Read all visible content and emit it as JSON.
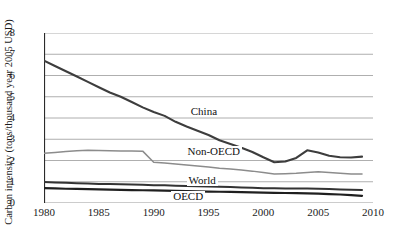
{
  "chart_data": {
    "type": "line",
    "title": "",
    "xlabel": "",
    "ylabel": "Carbon intensity (tons/thousand year 2005 USD)",
    "xlim": [
      1980,
      2010
    ],
    "ylim": [
      0,
      8
    ],
    "xticks": [
      "1980",
      "1985",
      "1990",
      "1995",
      "2000",
      "2005",
      "2010"
    ],
    "yticks": [
      "0",
      "1",
      "2",
      "3",
      "4",
      "5",
      "6",
      "7",
      "8"
    ],
    "grid": "horizontal",
    "legend_position": "inline-labels",
    "x": [
      1980,
      1981,
      1982,
      1983,
      1984,
      1985,
      1986,
      1987,
      1988,
      1989,
      1990,
      1991,
      1992,
      1993,
      1994,
      1995,
      1996,
      1997,
      1998,
      1999,
      2000,
      2001,
      2002,
      2003,
      2004,
      2005,
      2006,
      2007,
      2008,
      2009
    ],
    "series": [
      {
        "name": "China",
        "color": "#3d3d3d",
        "width": 2.1,
        "label": "China",
        "values": [
          6.7,
          6.45,
          6.2,
          5.95,
          5.7,
          5.45,
          5.2,
          5.0,
          4.75,
          4.5,
          4.28,
          4.1,
          3.82,
          3.6,
          3.4,
          3.2,
          2.95,
          2.78,
          2.6,
          2.4,
          2.15,
          1.92,
          1.95,
          2.12,
          2.48,
          2.38,
          2.22,
          2.15,
          2.14,
          2.18
        ]
      },
      {
        "name": "Non-OECD",
        "color": "#8c8c8c",
        "width": 1.5,
        "label": "Non-OECD",
        "values": [
          2.34,
          2.38,
          2.42,
          2.46,
          2.48,
          2.47,
          2.46,
          2.45,
          2.45,
          2.44,
          1.92,
          1.88,
          1.84,
          1.79,
          1.74,
          1.7,
          1.64,
          1.6,
          1.55,
          1.5,
          1.43,
          1.37,
          1.38,
          1.4,
          1.44,
          1.47,
          1.44,
          1.4,
          1.37,
          1.37
        ]
      },
      {
        "name": "World",
        "color": "#333333",
        "width": 2.0,
        "label": "World",
        "values": [
          0.99,
          0.97,
          0.95,
          0.93,
          0.92,
          0.9,
          0.89,
          0.88,
          0.87,
          0.86,
          0.84,
          0.83,
          0.81,
          0.8,
          0.79,
          0.78,
          0.76,
          0.75,
          0.73,
          0.72,
          0.7,
          0.69,
          0.68,
          0.68,
          0.68,
          0.67,
          0.66,
          0.64,
          0.62,
          0.61
        ]
      },
      {
        "name": "OECD",
        "color": "#1f1f1f",
        "width": 2.2,
        "label": "OECD",
        "values": [
          0.7,
          0.69,
          0.67,
          0.66,
          0.65,
          0.64,
          0.63,
          0.62,
          0.61,
          0.6,
          0.59,
          0.58,
          0.57,
          0.56,
          0.55,
          0.54,
          0.53,
          0.52,
          0.51,
          0.5,
          0.49,
          0.48,
          0.47,
          0.46,
          0.45,
          0.44,
          0.42,
          0.4,
          0.37,
          0.34
        ]
      }
    ],
    "annotations": [
      {
        "text": "China",
        "x": 1993.2,
        "y": 4.28
      },
      {
        "text": "Non-OECD",
        "x": 1992.9,
        "y": 2.38
      },
      {
        "text": "World",
        "x": 1993.0,
        "y": 1.02
      },
      {
        "text": "OECD",
        "x": 1991.6,
        "y": 0.26
      }
    ],
    "colors": {
      "grid": "#9a9a9a",
      "axis": "#2b2b2b",
      "background": "#ffffff"
    }
  }
}
